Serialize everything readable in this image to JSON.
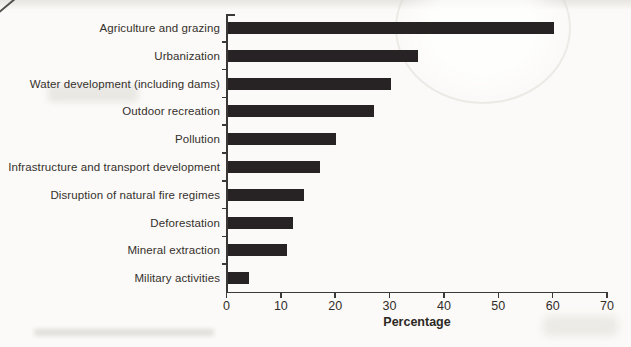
{
  "chart_data": {
    "type": "bar",
    "orientation": "horizontal",
    "title": "",
    "xlabel": "Percentage",
    "ylabel": "",
    "categories": [
      "Agriculture and grazing",
      "Urbanization",
      "Water development (including dams)",
      "Outdoor recreation",
      "Pollution",
      "Infrastructure and transport development",
      "Disruption of natural fire regimes",
      "Deforestation",
      "Mineral extraction",
      "Military activities"
    ],
    "values": [
      60,
      35,
      30,
      27,
      20,
      17,
      14,
      12,
      11,
      4
    ],
    "xlim": [
      0,
      70
    ],
    "xticks": [
      0,
      10,
      20,
      30,
      40,
      50,
      60,
      70
    ],
    "grid": false,
    "legend": false,
    "bar_color": "#272324",
    "axis_color": "#3c3836",
    "text_color": "#35302c"
  }
}
